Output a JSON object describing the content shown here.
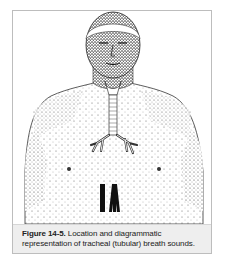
{
  "figure": {
    "label": "Figure 14-5.",
    "caption_text": " Location and diagrammatic representation of tracheal (tubular) breath sounds.",
    "illustration_subject": "male torso with trachea and bronchi outlined",
    "sound_diagram": "tubular breath sound bars"
  }
}
